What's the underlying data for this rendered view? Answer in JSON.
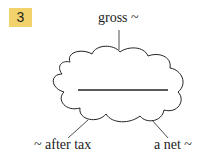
{
  "exercise": {
    "number": "3"
  },
  "diagram": {
    "center_blank": "",
    "labels": {
      "top": "gross ~",
      "bottom_left": "~ after tax",
      "bottom_right": "a net ~"
    },
    "colors": {
      "badge": "#f2d36b",
      "line": "#222222"
    }
  }
}
